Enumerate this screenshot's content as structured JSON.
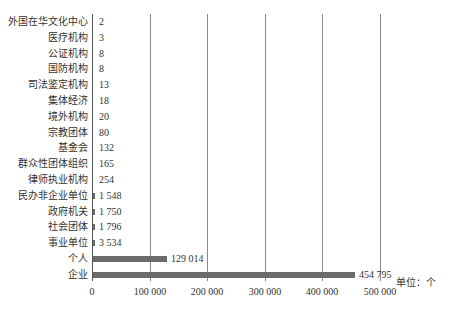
{
  "chart_data": {
    "type": "bar",
    "orientation": "horizontal",
    "title": "",
    "xlabel": "",
    "ylabel": "",
    "unit_label": "单位：个",
    "xlim": [
      0,
      500000
    ],
    "x_ticks": [
      0,
      100000,
      200000,
      300000,
      400000,
      500000
    ],
    "x_tick_labels": [
      "0",
      "100 000",
      "200 000",
      "300 000",
      "400 000",
      "500 000"
    ],
    "grid": "vertical",
    "legend": null,
    "categories": [
      "外国在华文化中心",
      "医疗机构",
      "公证机构",
      "国防机构",
      "司法鉴定机构",
      "集体经济",
      "境外机构",
      "宗教团体",
      "基金会",
      "群众性团体组织",
      "律师执业机构",
      "民办非企业单位",
      "政府机关",
      "社会团体",
      "事业单位",
      "个人",
      "企业"
    ],
    "values": [
      2,
      3,
      8,
      8,
      13,
      18,
      20,
      80,
      132,
      165,
      254,
      1548,
      1750,
      1796,
      3534,
      129014,
      454795
    ],
    "value_labels": [
      "2",
      "3",
      "8",
      "8",
      "13",
      "18",
      "20",
      "80",
      "132",
      "165",
      "254",
      "1 548",
      "1 750",
      "1 796",
      "3 534",
      "129 014",
      "454 795"
    ],
    "bar_color": "#6b6b6b"
  }
}
